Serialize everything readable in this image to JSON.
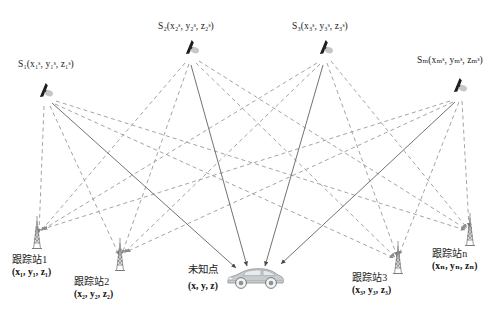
{
  "figure": {
    "type": "satellite-tracking-station-diagram",
    "background_color": "#ffffff",
    "line_colors": {
      "solid_measurement": "#555555",
      "dashed_link": "#8a8a8a"
    }
  },
  "satellites": [
    {
      "id": "S1",
      "name_prefix": "S",
      "index": "1",
      "label_text": "S₁(x₁ˢ, y₁ˢ, z₁ˢ)",
      "coords": {
        "x": "x",
        "y": "y",
        "z": "z",
        "sub": "1",
        "sup": "s"
      },
      "icon": "satellite-icon",
      "position": {
        "x": 44,
        "y": 95
      },
      "label_position": {
        "x": 18,
        "y": 59
      }
    },
    {
      "id": "S2",
      "name_prefix": "S",
      "index": "2",
      "label_text": "S₂(x₂ˢ, y₂ˢ, z₂ˢ)",
      "coords": {
        "x": "x",
        "y": "y",
        "z": "z",
        "sub": "2",
        "sup": "s"
      },
      "icon": "satellite-icon",
      "position": {
        "x": 190,
        "y": 52
      },
      "label_position": {
        "x": 158,
        "y": 21
      }
    },
    {
      "id": "S3",
      "name_prefix": "S",
      "index": "3",
      "label_text": "S₃(x₃ˢ, y₃ˢ, z₃ˢ)",
      "coords": {
        "x": "x",
        "y": "y",
        "z": "z",
        "sub": "3",
        "sup": "s"
      },
      "icon": "satellite-icon",
      "position": {
        "x": 324,
        "y": 52
      },
      "label_position": {
        "x": 292,
        "y": 21
      }
    },
    {
      "id": "Sm",
      "name_prefix": "S",
      "index": "m",
      "label_text": "Sₘ(xₘˢ, yₘˢ, zₘˢ)",
      "coords": {
        "x": "x",
        "y": "y",
        "z": "z",
        "sub": "m",
        "sup": "s"
      },
      "icon": "satellite-icon",
      "position": {
        "x": 458,
        "y": 90
      },
      "label_position": {
        "x": 417,
        "y": 55
      }
    }
  ],
  "tracking_stations": [
    {
      "id": "GS1",
      "name": "跟踪站1",
      "coord_text": "(x₁, y₁, z₁)",
      "coords": {
        "sub": "1"
      },
      "icon": "antenna-tower-icon",
      "position": {
        "x": 37,
        "y": 253
      },
      "label_position": {
        "x": 12,
        "y": 254
      }
    },
    {
      "id": "GS2",
      "name": "跟踪站2",
      "coord_text": "(x₂, y₂, z₂)",
      "coords": {
        "sub": "2"
      },
      "icon": "antenna-tower-icon",
      "position": {
        "x": 120,
        "y": 275
      },
      "label_position": {
        "x": 74,
        "y": 276
      }
    },
    {
      "id": "GS3",
      "name": "跟踪站3",
      "coord_text": "(x₃, y₃, z₃)",
      "coords": {
        "sub": "3"
      },
      "icon": "antenna-tower-icon",
      "position": {
        "x": 398,
        "y": 278
      },
      "label_position": {
        "x": 352,
        "y": 272
      }
    },
    {
      "id": "GSn",
      "name": "跟踪站n",
      "coord_text": "(xₙ, yₙ, zₙ)",
      "coords": {
        "sub": "n"
      },
      "icon": "antenna-tower-icon",
      "position": {
        "x": 470,
        "y": 250
      },
      "label_position": {
        "x": 432,
        "y": 248
      }
    }
  ],
  "unknown_point": {
    "id": "U",
    "name": "未知点",
    "coord_text": "(x, y, z)",
    "icon": "car-icon",
    "position": {
      "x": 255,
      "y": 278
    },
    "label_position": {
      "x": 188,
      "y": 263
    }
  },
  "links": {
    "solid_from_satellites_to_unknown": [
      {
        "from": "S1",
        "to": "U"
      },
      {
        "from": "S2",
        "to": "U"
      },
      {
        "from": "S3",
        "to": "U"
      },
      {
        "from": "Sm",
        "to": "U"
      }
    ],
    "dashed_satellite_to_station": [
      {
        "from": "S1",
        "to": "GS1"
      },
      {
        "from": "S1",
        "to": "GS2"
      },
      {
        "from": "S1",
        "to": "GS3"
      },
      {
        "from": "S1",
        "to": "GSn"
      },
      {
        "from": "S2",
        "to": "GS1"
      },
      {
        "from": "S2",
        "to": "GS2"
      },
      {
        "from": "S2",
        "to": "GS3"
      },
      {
        "from": "S2",
        "to": "GSn"
      },
      {
        "from": "S3",
        "to": "GS1"
      },
      {
        "from": "S3",
        "to": "GS2"
      },
      {
        "from": "S3",
        "to": "GS3"
      },
      {
        "from": "S3",
        "to": "GSn"
      },
      {
        "from": "Sm",
        "to": "GS1"
      },
      {
        "from": "Sm",
        "to": "GS2"
      },
      {
        "from": "Sm",
        "to": "GS3"
      },
      {
        "from": "Sm",
        "to": "GSn"
      }
    ]
  }
}
